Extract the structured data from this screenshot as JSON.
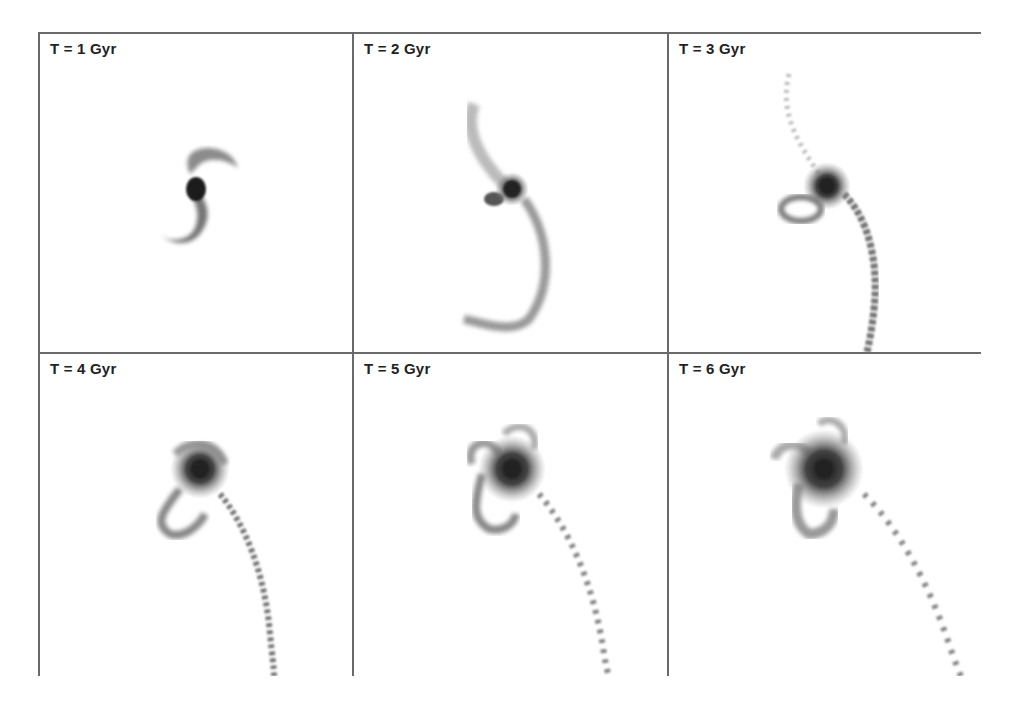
{
  "figure": {
    "layout": {
      "rows": 2,
      "cols": 3
    },
    "panels": [
      {
        "label": "T = 1 Gyr",
        "time_gyr": 1
      },
      {
        "label": "T = 2 Gyr",
        "time_gyr": 2
      },
      {
        "label": "T = 3 Gyr",
        "time_gyr": 3
      },
      {
        "label": "T = 4 Gyr",
        "time_gyr": 4
      },
      {
        "label": "T = 5 Gyr",
        "time_gyr": 5
      },
      {
        "label": "T = 6 Gyr",
        "time_gyr": 6
      }
    ],
    "colors": {
      "border": "#6a6a6a",
      "background": "#ffffff",
      "density_dark": "#1a1a1a",
      "density_light": "#9a9a9a"
    }
  }
}
